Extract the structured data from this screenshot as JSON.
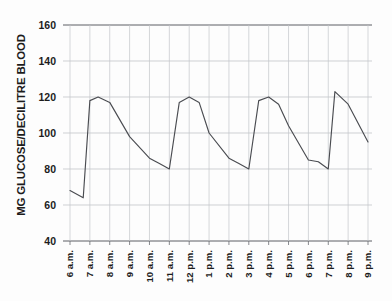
{
  "chart_data": {
    "type": "line",
    "title": "",
    "subtitle": "",
    "xlabel": "",
    "ylabel": "MG GLUCOSE/DECILITRE BLOOD",
    "ylim": [
      40,
      160
    ],
    "yticks": [
      40,
      60,
      80,
      100,
      120,
      140,
      160
    ],
    "ytick_labels": [
      "40",
      "60",
      "80",
      "100",
      "120",
      "140",
      "160"
    ],
    "grid": true,
    "grid_axis": "both",
    "legend": false,
    "legend_position": "none",
    "categories": [
      "6 a.m.",
      "7 a.m.",
      "8 a.m.",
      "9 a.m.",
      "10 a.m.",
      "11 a.m.",
      "12 p.m.",
      "1 p.m.",
      "2 p.m.",
      "3 p.m.",
      "4 p.m.",
      "5 p.m.",
      "6 p.m.",
      "7 p.m.",
      "8 p.m.",
      "9 p.m."
    ],
    "x": [
      "6 a.m.",
      "7 a.m.",
      "8 a.m.",
      "9 a.m.",
      "10 a.m.",
      "11 a.m.",
      "12 p.m.",
      "1 p.m.",
      "2 p.m.",
      "3 p.m.",
      "4 p.m.",
      "5 p.m.",
      "6 p.m.",
      "7 p.m.",
      "8 p.m.",
      "9 p.m."
    ],
    "series": [
      {
        "name": "Blood glucose",
        "values": [
          68,
          64,
          118,
          117,
          98,
          80,
          120,
          116,
          86,
          80,
          120,
          104,
          85,
          80,
          116,
          95
        ]
      }
    ],
    "points": [
      {
        "time": "6 a.m.",
        "value": 68
      },
      {
        "time": "6:40 a.m.",
        "value": 64
      },
      {
        "time": "7 a.m.",
        "value": 118
      },
      {
        "time": "7:25 a.m.",
        "value": 120
      },
      {
        "time": "8 a.m.",
        "value": 117
      },
      {
        "time": "9 a.m.",
        "value": 98
      },
      {
        "time": "10 a.m.",
        "value": 86
      },
      {
        "time": "10:30 a.m.",
        "value": 83
      },
      {
        "time": "11 a.m.",
        "value": 80
      },
      {
        "time": "11:30 a.m.",
        "value": 117
      },
      {
        "time": "12 p.m.",
        "value": 120
      },
      {
        "time": "12:30 p.m.",
        "value": 117
      },
      {
        "time": "1 p.m.",
        "value": 100
      },
      {
        "time": "2 p.m.",
        "value": 86
      },
      {
        "time": "2:30 p.m.",
        "value": 83
      },
      {
        "time": "3 p.m.",
        "value": 80
      },
      {
        "time": "3:30 p.m.",
        "value": 118
      },
      {
        "time": "4 p.m.",
        "value": 120
      },
      {
        "time": "4:30 p.m.",
        "value": 116
      },
      {
        "time": "5 p.m.",
        "value": 104
      },
      {
        "time": "6 p.m.",
        "value": 85
      },
      {
        "time": "6:30 p.m.",
        "value": 84
      },
      {
        "time": "7 p.m.",
        "value": 80
      },
      {
        "time": "7:20 p.m.",
        "value": 123
      },
      {
        "time": "8 p.m.",
        "value": 116
      },
      {
        "time": "9 p.m.",
        "value": 95
      }
    ],
    "colors": {
      "line": "#4a4c51",
      "grid": "#b9bbc0",
      "axis": "#4b4d52",
      "text": "#1c1c1c",
      "background": "#fdfdfd"
    }
  }
}
